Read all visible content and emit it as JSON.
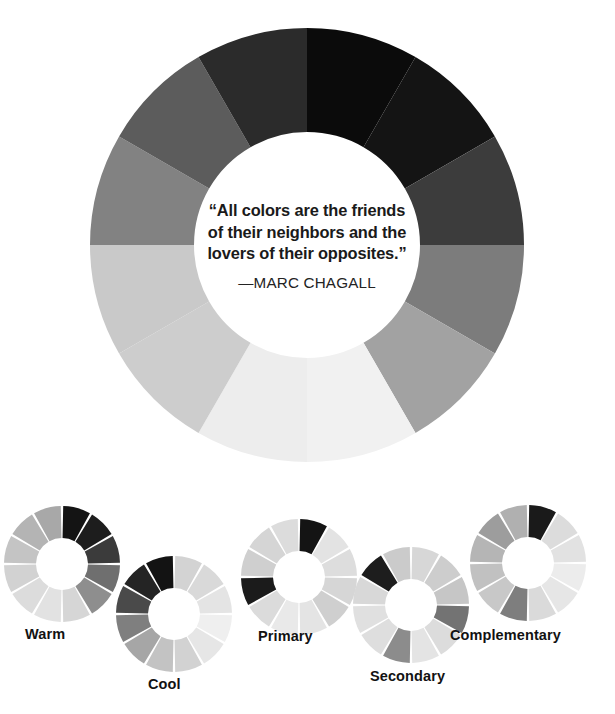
{
  "page": {
    "background": "#ffffff",
    "width": 615,
    "height": 714
  },
  "main_wheel": {
    "name": "color-wheel",
    "center": {
      "x": 307,
      "y": 245
    },
    "outer_radius": 217,
    "inner_radius": 113,
    "segment_count": 12,
    "start_angle_deg": -90,
    "segment_span_deg": 30,
    "segment_colors": [
      "#0b0b0b",
      "#141414",
      "#3c3c3c",
      "#7c7c7c",
      "#a2a2a2",
      "#f1f1f1",
      "#ededed",
      "#cdcdcd",
      "#c9c9c9",
      "#828282",
      "#5c5c5c",
      "#2b2b2b"
    ],
    "quote": {
      "line1": "“All colors are the friends",
      "line2": "of their neighbors and the",
      "line3": "lovers of their opposites.”",
      "attribution": "—MARC CHAGALL"
    }
  },
  "mini_wheels": [
    {
      "id": "warm",
      "label": "Warm",
      "center": {
        "x": 62,
        "y": 564
      },
      "outer_radius": 58,
      "inner_radius": 26,
      "gap_deg": 2.4,
      "label_pos": {
        "x": 25,
        "y": 626
      },
      "segment_colors": [
        "#141414",
        "#1d1d1d",
        "#3b3b3b",
        "#6f6f6f",
        "#8e8e8e",
        "#d6d6d6",
        "#e2e2e2",
        "#dcdcdc",
        "#d2d2d2",
        "#c4c4c4",
        "#b4b4b4",
        "#a8a8a8"
      ]
    },
    {
      "id": "cool",
      "label": "Cool",
      "center": {
        "x": 174,
        "y": 614
      },
      "outer_radius": 58,
      "inner_radius": 26,
      "gap_deg": 2.4,
      "label_pos": {
        "x": 148,
        "y": 676
      },
      "segment_colors": [
        "#d3d3d3",
        "#d9d9d9",
        "#e4e4e4",
        "#efefef",
        "#e6e6e6",
        "#d2d2d2",
        "#c3c3c3",
        "#a6a6a6",
        "#7f7f7f",
        "#4a4a4a",
        "#242424",
        "#131313"
      ]
    },
    {
      "id": "primary",
      "label": "Primary",
      "center": {
        "x": 299,
        "y": 577
      },
      "outer_radius": 58,
      "inner_radius": 26,
      "gap_deg": 2.4,
      "label_pos": {
        "x": 258,
        "y": 628
      },
      "segment_colors": [
        "#141414",
        "#e3e3e3",
        "#dddddd",
        "#d6d6d6",
        "#cfcfcf",
        "#e4e4e4",
        "#e9e9e9",
        "#dbdbdb",
        "#1b1b1b",
        "#cfcfcf",
        "#d5d5d5",
        "#dcdcdc"
      ]
    },
    {
      "id": "secondary",
      "label": "Secondary",
      "center": {
        "x": 411,
        "y": 605
      },
      "outer_radius": 58,
      "inner_radius": 26,
      "gap_deg": 2.4,
      "label_pos": {
        "x": 370,
        "y": 668
      },
      "segment_colors": [
        "#d7d7d7",
        "#cdcdcd",
        "#c6c6c6",
        "#737373",
        "#dcdcdc",
        "#e4e4e4",
        "#8c8c8c",
        "#dedede",
        "#e0e0e0",
        "#d8d8d8",
        "#1d1d1d",
        "#cbcbcb"
      ]
    },
    {
      "id": "complementary",
      "label": "Complementary",
      "center": {
        "x": 528,
        "y": 563
      },
      "outer_radius": 58,
      "inner_radius": 26,
      "gap_deg": 2.4,
      "label_pos": {
        "x": 450,
        "y": 627
      },
      "segment_colors": [
        "#1a1a1a",
        "#dcdcdc",
        "#e2e2e2",
        "#ececec",
        "#e6e6e6",
        "#dadada",
        "#7e7e7e",
        "#c8c8c8",
        "#c1c1c1",
        "#b5b5b5",
        "#9d9d9d",
        "#b0b0b0"
      ]
    }
  ]
}
